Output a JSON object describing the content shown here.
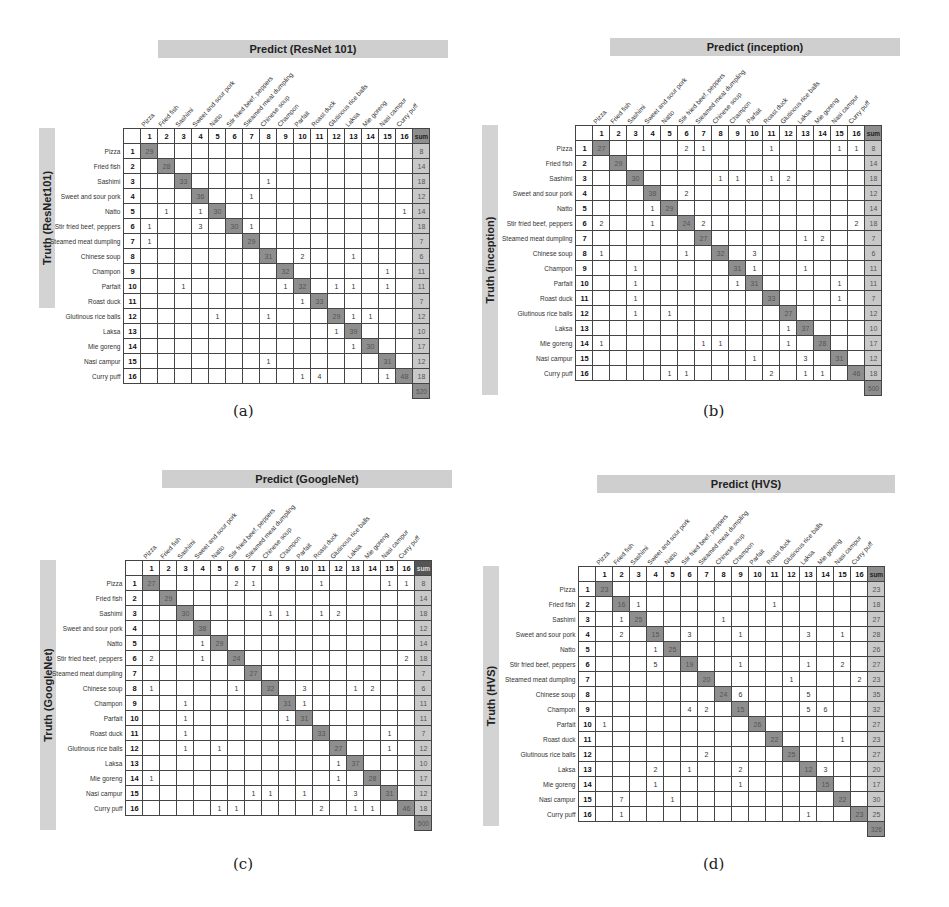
{
  "labels": [
    "Pizza",
    "Fried fish",
    "Sashimi",
    "Sweet and sour pork",
    "Natto",
    "Stir fried beef, peppers",
    "Steamed meat dumpling",
    "Chinese soup",
    "Champon",
    "Parfait",
    "Roast duck",
    "Glutinous rice balls",
    "Laksa",
    "Mie goreng",
    "Nasi campur",
    "Curry puff"
  ],
  "sum_label": "sum",
  "chart_data": [
    {
      "type": "heatmap",
      "panel": "a",
      "caption": "(a)",
      "title": "Predict (ResNet 101)",
      "ylabel": "Truth (ResNet101)",
      "xlabel": "Predict (ResNet 101)",
      "categories": [
        "Pizza",
        "Fried fish",
        "Sashimi",
        "Sweet and sour pork",
        "Natto",
        "Stir fried beef, peppers",
        "Steamed meat dumpling",
        "Chinese soup",
        "Champon",
        "Parfait",
        "Roast duck",
        "Glutinous rice balls",
        "Laksa",
        "Mie goreng",
        "Nasi campur",
        "Curry puff"
      ],
      "matrix": [
        [
          29,
          "",
          "",
          "",
          "",
          "",
          "",
          "",
          "",
          "",
          "",
          "",
          "",
          "",
          "",
          ""
        ],
        [
          "",
          28,
          "",
          "",
          "",
          "",
          "",
          "",
          "",
          "",
          "",
          "",
          "",
          "",
          "",
          ""
        ],
        [
          "",
          "",
          33,
          "",
          "",
          "",
          "",
          1,
          "",
          "",
          "",
          "",
          "",
          "",
          "",
          ""
        ],
        [
          "",
          "",
          "",
          36,
          "",
          "",
          1,
          "",
          "",
          "",
          "",
          "",
          "",
          "",
          "",
          ""
        ],
        [
          "",
          1,
          "",
          1,
          30,
          "",
          "",
          "",
          "",
          "",
          "",
          "",
          "",
          "",
          "",
          1
        ],
        [
          1,
          "",
          "",
          3,
          "",
          30,
          1,
          "",
          "",
          "",
          "",
          "",
          "",
          "",
          "",
          ""
        ],
        [
          1,
          "",
          "",
          "",
          "",
          "",
          29,
          "",
          "",
          "",
          "",
          "",
          "",
          "",
          "",
          ""
        ],
        [
          "",
          "",
          "",
          "",
          "",
          "",
          "",
          31,
          "",
          2,
          "",
          "",
          1,
          "",
          "",
          ""
        ],
        [
          "",
          "",
          "",
          "",
          "",
          "",
          "",
          "",
          32,
          "",
          "",
          "",
          "",
          "",
          1,
          ""
        ],
        [
          "",
          "",
          1,
          "",
          "",
          "",
          "",
          "",
          1,
          32,
          "",
          1,
          1,
          "",
          1,
          ""
        ],
        [
          "",
          "",
          "",
          "",
          "",
          "",
          "",
          "",
          "",
          1,
          33,
          "",
          "",
          "",
          "",
          ""
        ],
        [
          "",
          "",
          "",
          "",
          1,
          "",
          "",
          1,
          "",
          "",
          "",
          29,
          1,
          1,
          "",
          ""
        ],
        [
          "",
          "",
          "",
          "",
          "",
          "",
          "",
          "",
          "",
          "",
          "",
          1,
          39,
          "",
          "",
          ""
        ],
        [
          "",
          "",
          "",
          "",
          "",
          "",
          "",
          "",
          "",
          "",
          "",
          "",
          1,
          30,
          "",
          ""
        ],
        [
          "",
          "",
          "",
          "",
          "",
          "",
          "",
          1,
          "",
          "",
          "",
          "",
          "",
          "",
          31,
          ""
        ],
        [
          "",
          "",
          "",
          "",
          "",
          "",
          "",
          "",
          "",
          1,
          4,
          "",
          "",
          "",
          1,
          48
        ]
      ],
      "row_sums": [
        8,
        14,
        18,
        12,
        14,
        18,
        7,
        6,
        11,
        11,
        7,
        12,
        10,
        17,
        12,
        18
      ],
      "total": 520
    },
    {
      "type": "heatmap",
      "panel": "b",
      "caption": "(b)",
      "title": "Predict (inception)",
      "ylabel": "Truth (inception)",
      "xlabel": "Predict (inception)",
      "categories": [
        "Pizza",
        "Fried fish",
        "Sashimi",
        "Sweet and sour pork",
        "Natto",
        "Stir fried beef, peppers",
        "Steamed meat dumpling",
        "Chinese soup",
        "Champon",
        "Parfait",
        "Roast duck",
        "Glutinous rice balls",
        "Laksa",
        "Mie goreng",
        "Nasi campur",
        "Curry puff"
      ],
      "matrix": [
        [
          27,
          "",
          "",
          "",
          "",
          2,
          1,
          "",
          "",
          "",
          1,
          "",
          "",
          "",
          1,
          1
        ],
        [
          "",
          29,
          "",
          "",
          "",
          "",
          "",
          "",
          "",
          "",
          "",
          "",
          "",
          "",
          "",
          ""
        ],
        [
          "",
          "",
          30,
          "",
          "",
          "",
          "",
          1,
          1,
          "",
          1,
          2,
          "",
          "",
          "",
          ""
        ],
        [
          "",
          "",
          "",
          38,
          "",
          2,
          "",
          "",
          "",
          "",
          "",
          "",
          "",
          "",
          "",
          ""
        ],
        [
          "",
          "",
          "",
          1,
          29,
          "",
          "",
          "",
          "",
          "",
          "",
          "",
          "",
          "",
          "",
          ""
        ],
        [
          2,
          "",
          "",
          1,
          "",
          24,
          2,
          "",
          "",
          "",
          "",
          "",
          "",
          "",
          "",
          2
        ],
        [
          "",
          "",
          "",
          "",
          "",
          "",
          27,
          "",
          "",
          "",
          "",
          "",
          1,
          2,
          "",
          ""
        ],
        [
          1,
          "",
          "",
          "",
          "",
          1,
          "",
          32,
          "",
          3,
          "",
          "",
          "",
          "",
          "",
          ""
        ],
        [
          "",
          "",
          1,
          "",
          "",
          "",
          "",
          "",
          31,
          1,
          "",
          "",
          1,
          "",
          "",
          ""
        ],
        [
          "",
          "",
          1,
          "",
          "",
          "",
          "",
          "",
          1,
          31,
          "",
          "",
          "",
          "",
          1,
          ""
        ],
        [
          "",
          "",
          1,
          "",
          "",
          "",
          "",
          "",
          "",
          "",
          33,
          "",
          "",
          "",
          1,
          ""
        ],
        [
          "",
          "",
          1,
          "",
          1,
          "",
          "",
          "",
          "",
          "",
          "",
          27,
          "",
          "",
          "",
          ""
        ],
        [
          "",
          "",
          "",
          "",
          "",
          "",
          "",
          "",
          "",
          "",
          "",
          1,
          37,
          "",
          "",
          ""
        ],
        [
          1,
          "",
          "",
          "",
          "",
          "",
          1,
          1,
          "",
          "",
          "",
          1,
          "",
          28,
          "",
          ""
        ],
        [
          "",
          "",
          "",
          "",
          "",
          "",
          "",
          "",
          "",
          1,
          "",
          "",
          3,
          "",
          31,
          ""
        ],
        [
          "",
          "",
          "",
          "",
          1,
          1,
          "",
          "",
          "",
          "",
          2,
          "",
          1,
          1,
          "",
          46
        ]
      ],
      "row_sums": [
        8,
        14,
        18,
        12,
        14,
        18,
        7,
        6,
        11,
        11,
        7,
        12,
        10,
        17,
        12,
        18
      ],
      "total": 500
    },
    {
      "type": "heatmap",
      "panel": "c",
      "caption": "(c)",
      "title": "Predict (GoogleNet)",
      "ylabel": "Truth (GoogleNet)",
      "xlabel": "Predict (GoogleNet)",
      "categories": [
        "Pizza",
        "Fried fish",
        "Sashimi",
        "Sweet and sour pork",
        "Natto",
        "Stir fried beef, peppers",
        "Steamed meat dumpling",
        "Chinese soup",
        "Champon",
        "Parfait",
        "Roast duck",
        "Glutinous rice balls",
        "Laksa",
        "Mie goreng",
        "Nasi campur",
        "Curry puff"
      ],
      "matrix": [
        [
          27,
          "",
          "",
          "",
          "",
          2,
          1,
          "",
          "",
          "",
          1,
          "",
          "",
          "",
          1,
          1
        ],
        [
          "",
          29,
          "",
          "",
          "",
          "",
          "",
          "",
          "",
          "",
          "",
          "",
          "",
          "",
          "",
          ""
        ],
        [
          "",
          "",
          30,
          "",
          "",
          "",
          "",
          1,
          1,
          "",
          1,
          2,
          "",
          "",
          "",
          ""
        ],
        [
          "",
          "",
          "",
          38,
          "",
          "",
          "",
          "",
          "",
          "",
          "",
          "",
          "",
          "",
          "",
          ""
        ],
        [
          "",
          "",
          "",
          1,
          29,
          "",
          "",
          "",
          "",
          "",
          "",
          "",
          "",
          "",
          "",
          ""
        ],
        [
          2,
          "",
          "",
          1,
          "",
          24,
          "",
          "",
          "",
          "",
          "",
          "",
          "",
          "",
          "",
          2
        ],
        [
          "",
          "",
          "",
          "",
          "",
          "",
          27,
          "",
          "",
          "",
          "",
          "",
          "",
          "",
          "",
          ""
        ],
        [
          1,
          "",
          "",
          "",
          "",
          1,
          "",
          32,
          "",
          3,
          "",
          "",
          1,
          2,
          "",
          ""
        ],
        [
          "",
          "",
          1,
          "",
          "",
          "",
          "",
          "",
          31,
          1,
          "",
          "",
          "",
          "",
          "",
          ""
        ],
        [
          "",
          "",
          1,
          "",
          "",
          "",
          "",
          "",
          1,
          31,
          "",
          "",
          "",
          "",
          "",
          ""
        ],
        [
          "",
          "",
          1,
          "",
          "",
          "",
          "",
          "",
          "",
          "",
          33,
          "",
          "",
          "",
          1,
          ""
        ],
        [
          "",
          "",
          1,
          "",
          1,
          "",
          "",
          "",
          "",
          "",
          "",
          27,
          "",
          "",
          1,
          ""
        ],
        [
          "",
          "",
          "",
          "",
          "",
          "",
          "",
          "",
          "",
          "",
          "",
          1,
          37,
          "",
          "",
          ""
        ],
        [
          1,
          "",
          "",
          "",
          "",
          "",
          "",
          "",
          "",
          "",
          "",
          1,
          "",
          28,
          "",
          ""
        ],
        [
          "",
          "",
          "",
          "",
          "",
          "",
          1,
          1,
          "",
          1,
          "",
          "",
          3,
          "",
          31,
          ""
        ],
        [
          "",
          "",
          "",
          "",
          1,
          1,
          "",
          "",
          "",
          "",
          2,
          "",
          1,
          1,
          "",
          46
        ]
      ],
      "row_sums": [
        8,
        14,
        18,
        12,
        14,
        18,
        7,
        6,
        11,
        11,
        7,
        12,
        10,
        17,
        12,
        18
      ],
      "total": 500
    },
    {
      "type": "heatmap",
      "panel": "d",
      "caption": "(d)",
      "title": "Predict (HVS)",
      "ylabel": "Truth (HVS)",
      "xlabel": "Predict (HVS)",
      "categories": [
        "Pizza",
        "Fried fish",
        "Sashimi",
        "Sweet and sour pork",
        "Natto",
        "Stir fried beef, peppers",
        "Steamed meat dumpling",
        "Chinese soup",
        "Champon",
        "Parfait",
        "Roast duck",
        "Glutinous rice balls",
        "Laksa",
        "Mie goreng",
        "Nasi campur",
        "Curry puff"
      ],
      "matrix": [
        [
          23,
          "",
          "",
          "",
          "",
          "",
          "",
          "",
          "",
          "",
          "",
          "",
          "",
          "",
          "",
          ""
        ],
        [
          "",
          16,
          1,
          "",
          "",
          "",
          "",
          "",
          "",
          "",
          1,
          "",
          "",
          "",
          "",
          ""
        ],
        [
          "",
          1,
          25,
          "",
          "",
          "",
          "",
          1,
          "",
          "",
          "",
          "",
          "",
          "",
          "",
          ""
        ],
        [
          "",
          2,
          "",
          15,
          "",
          3,
          "",
          "",
          1,
          "",
          "",
          "",
          3,
          "",
          1,
          ""
        ],
        [
          "",
          "",
          "",
          1,
          25,
          "",
          "",
          "",
          "",
          "",
          "",
          "",
          "",
          "",
          "",
          ""
        ],
        [
          "",
          "",
          "",
          5,
          "",
          19,
          "",
          "",
          1,
          "",
          "",
          "",
          1,
          "",
          2,
          ""
        ],
        [
          "",
          "",
          "",
          "",
          "",
          "",
          20,
          "",
          "",
          "",
          "",
          1,
          "",
          "",
          "",
          2
        ],
        [
          "",
          "",
          "",
          "",
          "",
          "",
          "",
          24,
          6,
          "",
          "",
          "",
          5,
          "",
          "",
          ""
        ],
        [
          "",
          "",
          "",
          "",
          "",
          4,
          2,
          "",
          15,
          "",
          "",
          "",
          5,
          6,
          "",
          ""
        ],
        [
          1,
          "",
          "",
          "",
          "",
          "",
          "",
          "",
          "",
          26,
          "",
          "",
          "",
          "",
          "",
          ""
        ],
        [
          "",
          "",
          "",
          "",
          "",
          "",
          "",
          "",
          "",
          "",
          22,
          "",
          "",
          "",
          1,
          ""
        ],
        [
          "",
          "",
          "",
          "",
          "",
          "",
          2,
          "",
          "",
          "",
          "",
          25,
          "",
          "",
          "",
          ""
        ],
        [
          "",
          "",
          "",
          2,
          "",
          1,
          "",
          "",
          2,
          "",
          "",
          "",
          12,
          3,
          "",
          ""
        ],
        [
          "",
          "",
          "",
          1,
          "",
          "",
          "",
          "",
          1,
          "",
          "",
          "",
          "",
          15,
          "",
          ""
        ],
        [
          "",
          7,
          "",
          "",
          1,
          "",
          "",
          "",
          "",
          "",
          "",
          "",
          "",
          "",
          22,
          ""
        ],
        [
          "",
          1,
          "",
          "",
          "",
          "",
          "",
          "",
          "",
          "",
          "",
          "",
          1,
          "",
          "",
          23
        ]
      ],
      "row_sums": [
        23,
        18,
        27,
        28,
        26,
        27,
        23,
        35,
        32,
        27,
        23,
        27,
        20,
        17,
        30,
        25
      ],
      "total": 326
    }
  ]
}
